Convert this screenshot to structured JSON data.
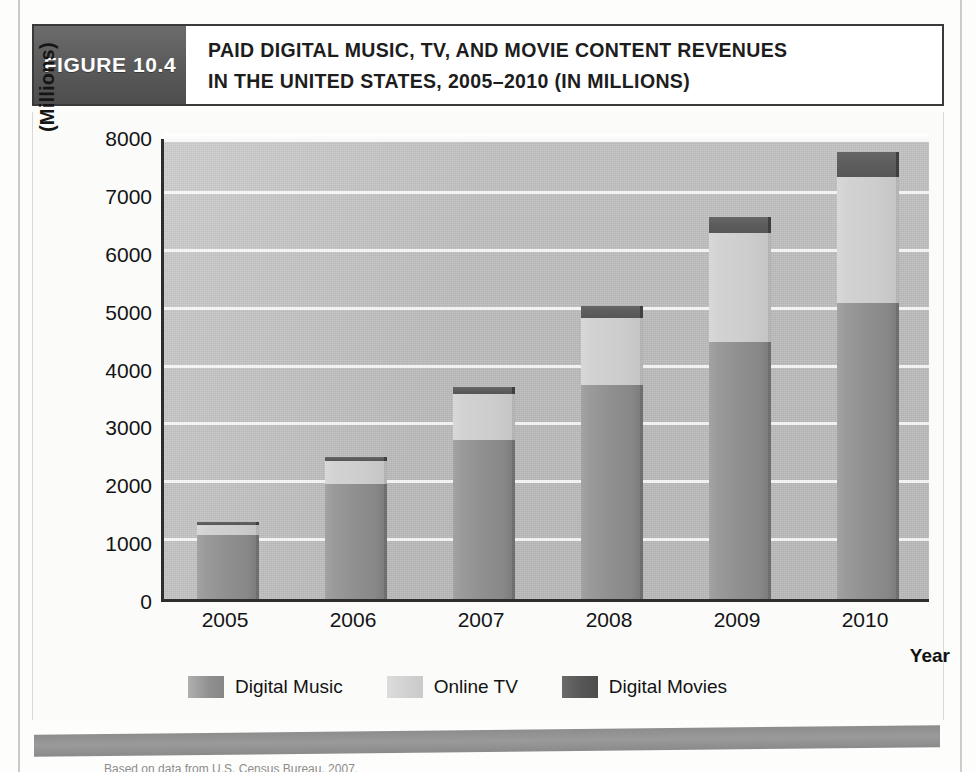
{
  "figure": {
    "number_label": "FIGURE 10.4",
    "title_line1": "PAID DIGITAL MUSIC, TV, AND MOVIE CONTENT REVENUES",
    "title_line2": "IN THE UNITED STATES, 2005–2010 (IN MILLIONS)"
  },
  "axes": {
    "y_title": "(Millions)",
    "x_title": "Year"
  },
  "legend": {
    "items": [
      {
        "label": "Digital Music",
        "color": "#8f8f8f"
      },
      {
        "label": "Online TV",
        "color": "#d0d0d0"
      },
      {
        "label": "Digital Movies",
        "color": "#555555"
      }
    ]
  },
  "source": {
    "text": "Based on data from U.S. Census Bureau, 2007."
  },
  "chart_data": {
    "type": "bar",
    "stacked": true,
    "title": "Paid Digital Music, TV, and Movie Content Revenues in the United States, 2005–2010 (in Millions)",
    "xlabel": "Year",
    "ylabel": "(Millions)",
    "categories": [
      "2005",
      "2006",
      "2007",
      "2008",
      "2009",
      "2010"
    ],
    "yticks": [
      0,
      1000,
      2000,
      3000,
      4000,
      5000,
      6000,
      7000,
      8000
    ],
    "ytick_labels": [
      "0",
      "1000",
      "2000",
      "3000",
      "4000",
      "5000",
      "6000",
      "7000",
      "8000"
    ],
    "ylim": [
      0,
      8000
    ],
    "grid": true,
    "legend_position": "bottom",
    "series": [
      {
        "name": "Digital Music",
        "color": "#8f8f8f",
        "values": [
          1100,
          1980,
          2750,
          3700,
          4440,
          5110
        ]
      },
      {
        "name": "Online TV",
        "color": "#d0d0d0",
        "values": [
          180,
          400,
          800,
          1150,
          1880,
          2180
        ]
      },
      {
        "name": "Digital Movies",
        "color": "#555555",
        "values": [
          40,
          70,
          120,
          210,
          280,
          440
        ]
      }
    ],
    "totals": [
      1320,
      2450,
      3670,
      5060,
      6600,
      7730
    ]
  }
}
